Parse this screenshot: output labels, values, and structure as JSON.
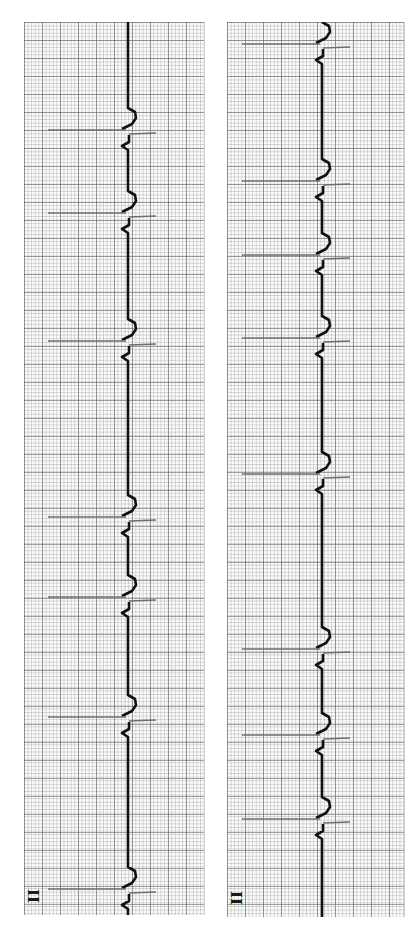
{
  "strips": [
    {
      "id": "left",
      "lead_label": "II",
      "box": {
        "x": 24,
        "y": 22,
        "w": 180,
        "h": 893
      },
      "baseline_x": 104,
      "qrs_y": [
        130,
        213,
        341,
        517,
        597,
        717,
        889
      ]
    },
    {
      "id": "right",
      "lead_label": "II",
      "box": {
        "x": 227,
        "y": 22,
        "w": 177,
        "h": 895
      },
      "baseline_x": 95,
      "qrs_y": [
        44,
        181,
        255,
        338,
        474,
        649,
        735,
        819
      ]
    }
  ],
  "colors": {
    "trace": "#111111",
    "spike": "#6e6e6e",
    "grid_major": "#5a5a5a",
    "grid_minor": "#8c8c8c",
    "paper": "#fbfbfb"
  }
}
